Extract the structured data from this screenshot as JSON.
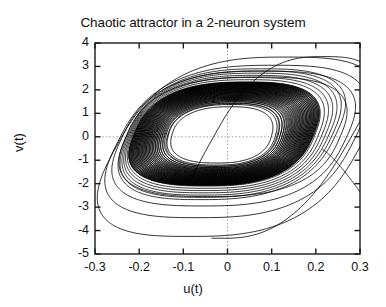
{
  "chart_data": {
    "type": "line",
    "title": "Chaotic attractor in a 2-neuron system",
    "xlabel": "u(t)",
    "ylabel": "v(t)",
    "xlim": [
      -0.3,
      0.3
    ],
    "ylim": [
      -5,
      4
    ],
    "xticks": [
      -0.3,
      -0.2,
      -0.1,
      0,
      0.1,
      0.2,
      0.3
    ],
    "xticklabels": [
      "-0.3",
      "-0.2",
      "-0.1",
      "0",
      "0.1",
      "0.2",
      "0.3"
    ],
    "yticks": [
      4,
      3,
      2,
      1,
      0,
      -1,
      -2,
      -3,
      -4,
      -5
    ],
    "yticklabels": [
      "4",
      "3",
      "2",
      "1",
      "0",
      "-1",
      "-2",
      "-3",
      "-4",
      "-5"
    ],
    "grid": true,
    "grid_style": "dotted",
    "grid_lines": [
      {
        "axis": "x",
        "value": 0
      },
      {
        "axis": "y",
        "value": 0
      }
    ],
    "legend": null,
    "line_color": "#000000",
    "background_color": "#ffffff",
    "series": [
      {
        "name": "trajectory",
        "dense_band": {
          "u_min": -0.215,
          "u_max": 0.195,
          "v_min": -2.1,
          "v_max": 2.25,
          "loop_count": 28
        },
        "outer_loops": [
          {
            "u_extent": [
              -0.23,
              0.255
            ],
            "v_extent": [
              -2.55,
              2.55
            ]
          },
          {
            "u_extent": [
              -0.24,
              0.268
            ],
            "v_extent": [
              -2.95,
              2.8
            ]
          },
          {
            "u_extent": [
              -0.248,
              0.285
            ],
            "v_extent": [
              -3.45,
              3.05
            ]
          },
          {
            "u_extent": [
              -0.252,
              0.3
            ],
            "v_extent": [
              -4.25,
              3.4
            ]
          }
        ]
      }
    ]
  },
  "plot_geometry": {
    "left_px": 95,
    "right_px": 360,
    "top_px": 43,
    "bottom_px": 254
  }
}
